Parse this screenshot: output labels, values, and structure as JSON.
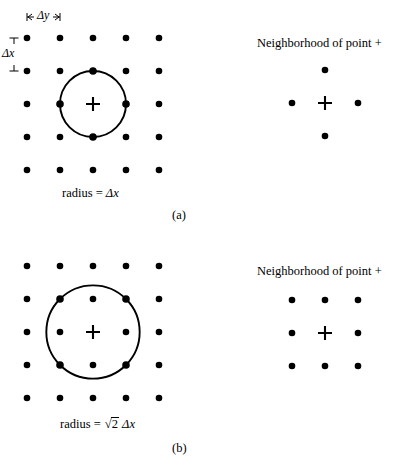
{
  "figure": {
    "background": "#ffffff",
    "ink": "#000000",
    "grid": {
      "rows": 5,
      "cols": 5,
      "spacing_px": 33,
      "dot_radius_px": 3.3
    },
    "panels": [
      {
        "id": "a",
        "label": "(a)",
        "radius_caption_prefix": "radius = ",
        "radius_caption_value": "Δx",
        "radius_in_spacings": 1,
        "circle_note": "circle passes through the 4 orthogonal neighbours",
        "grid_origin": {
          "x": 27,
          "y": 38
        },
        "center_index": {
          "row": 2,
          "col": 2
        },
        "center_marker": "plus",
        "marked_dots": [
          {
            "row": 1,
            "col": 2
          },
          {
            "row": 2,
            "col": 1
          },
          {
            "row": 2,
            "col": 3
          },
          {
            "row": 3,
            "col": 2
          }
        ],
        "dimension_y": {
          "label": "Δy",
          "orientation": "horizontal",
          "from_col": 0,
          "to_col": 1,
          "y": 17
        },
        "dimension_x": {
          "label": "Δx",
          "orientation": "vertical",
          "from_row": 0,
          "to_row": 1,
          "x": 14
        },
        "caption_position": {
          "x": 62,
          "y": 186
        },
        "label_position": {
          "x": 172,
          "y": 208
        },
        "neighborhood": {
          "heading": "Neighborhood of point +",
          "heading_position": {
            "x": 257,
            "y": 36
          },
          "center": {
            "x": 325,
            "y": 103
          },
          "spacing_px": 33,
          "center_marker": "plus",
          "offsets": [
            {
              "dx": 0,
              "dy": -1
            },
            {
              "dx": -1,
              "dy": 0
            },
            {
              "dx": 1,
              "dy": 0
            },
            {
              "dx": 0,
              "dy": 1
            }
          ],
          "count": 4,
          "shape": "plus"
        }
      },
      {
        "id": "b",
        "label": "(b)",
        "radius_caption_prefix": "radius = ",
        "radius_caption_sqrt_radicand": "2",
        "radius_caption_value": "Δx",
        "radius_in_spacings": 1.4142,
        "circle_note": "circle passes through the 4 diagonal neighbours",
        "grid_origin": {
          "x": 27,
          "y": 266
        },
        "center_index": {
          "row": 2,
          "col": 2
        },
        "center_marker": "plus",
        "marked_dots": [
          {
            "row": 1,
            "col": 1
          },
          {
            "row": 1,
            "col": 3
          },
          {
            "row": 3,
            "col": 1
          },
          {
            "row": 3,
            "col": 3
          }
        ],
        "caption_position": {
          "x": 60,
          "y": 417
        },
        "label_position": {
          "x": 172,
          "y": 441
        },
        "neighborhood": {
          "heading": "Neighborhood of point +",
          "heading_position": {
            "x": 257,
            "y": 264
          },
          "center": {
            "x": 325,
            "y": 333
          },
          "spacing_px": 33,
          "center_marker": "plus",
          "offsets": [
            {
              "dx": -1,
              "dy": -1
            },
            {
              "dx": 0,
              "dy": -1
            },
            {
              "dx": 1,
              "dy": -1
            },
            {
              "dx": -1,
              "dy": 0
            },
            {
              "dx": 1,
              "dy": 0
            },
            {
              "dx": -1,
              "dy": 1
            },
            {
              "dx": 0,
              "dy": 1
            },
            {
              "dx": 1,
              "dy": 1
            }
          ],
          "count": 8,
          "shape": "square"
        }
      }
    ]
  }
}
